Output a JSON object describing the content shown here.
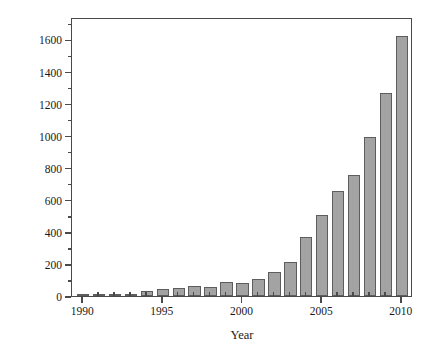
{
  "chart_data": {
    "type": "bar",
    "title": "",
    "xlabel": "Year",
    "ylabel": "Number of papers",
    "categories": [
      "1990",
      "1991",
      "1992",
      "1993",
      "1994",
      "1995",
      "1996",
      "1997",
      "1998",
      "1999",
      "2000",
      "2001",
      "2002",
      "2003",
      "2004",
      "2005",
      "2006",
      "2007",
      "2008",
      "2009",
      "2010"
    ],
    "values": [
      2,
      2,
      2,
      5,
      33,
      45,
      50,
      65,
      58,
      85,
      80,
      108,
      152,
      215,
      370,
      508,
      655,
      755,
      990,
      1265,
      1620
    ],
    "xlim": [
      1989.3,
      2010.7
    ],
    "ylim": [
      0,
      1740
    ],
    "xticks": [
      "1990",
      "1995",
      "2000",
      "2005",
      "2010"
    ],
    "yticks": [
      "0",
      "200",
      "400",
      "600",
      "800",
      "1000",
      "1200",
      "1400",
      "1600"
    ],
    "grid": false,
    "legend": null,
    "bar_color": "#a3a3a3",
    "bar_edge_color": "#5d5d5d",
    "axis_color": "#4a4a4a",
    "background": "#ffffff"
  }
}
